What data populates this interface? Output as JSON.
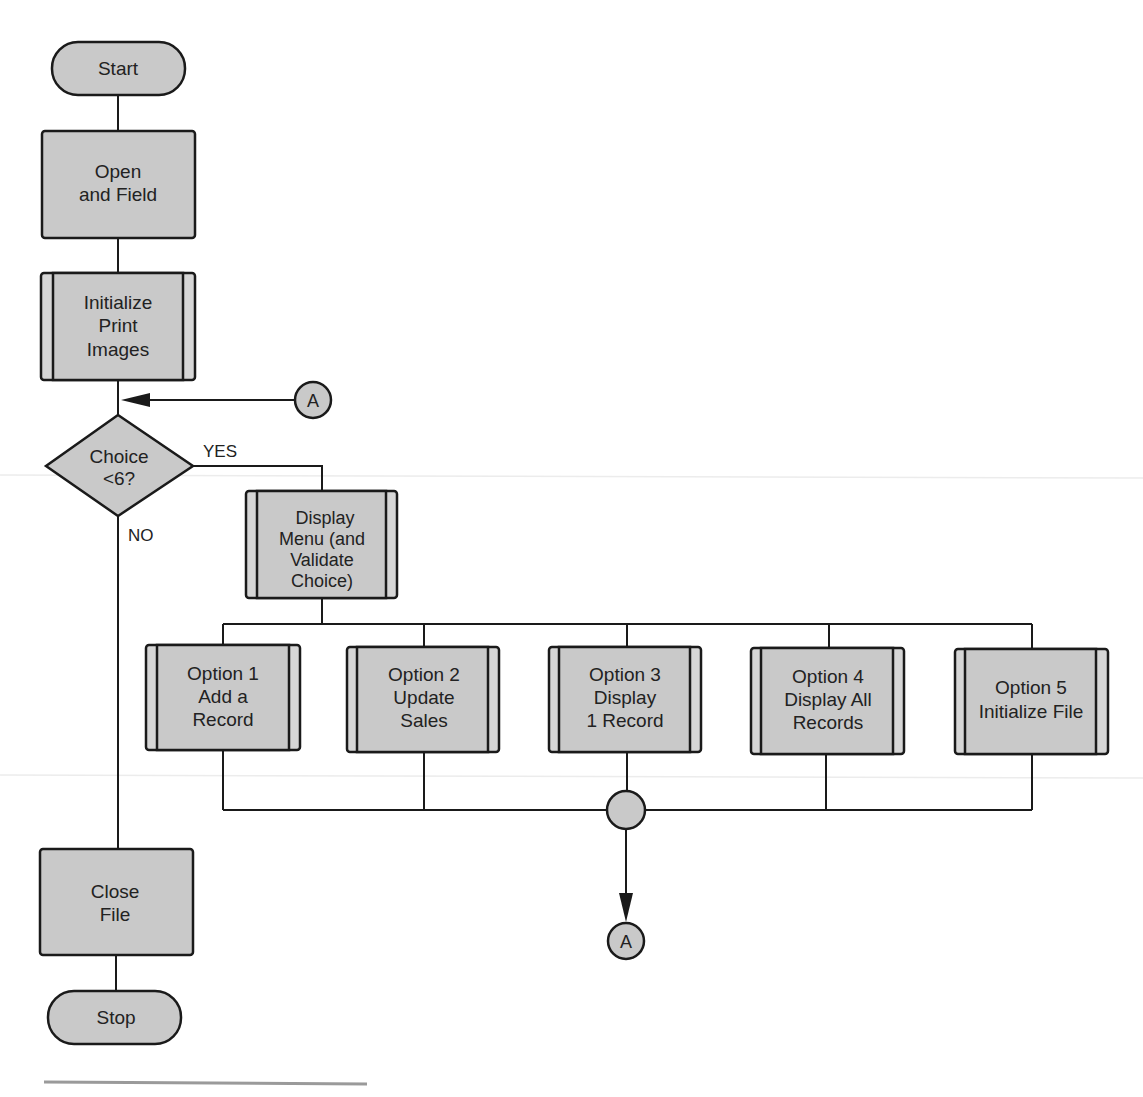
{
  "diagram": {
    "type": "flowchart",
    "colors": {
      "fill": "#c9c9c9",
      "stroke": "#1a1a1a",
      "text": "#222222",
      "background": "#ffffff"
    },
    "nodes": {
      "start": {
        "kind": "terminal",
        "lines": [
          "Start"
        ]
      },
      "open": {
        "kind": "process",
        "lines": [
          "Open",
          "and Field"
        ]
      },
      "init": {
        "kind": "predefined",
        "lines": [
          "Initialize",
          "Print",
          "Images"
        ]
      },
      "choice": {
        "kind": "decision",
        "lines": [
          "Choice",
          "<6?"
        ]
      },
      "display": {
        "kind": "predefined",
        "lines": [
          "Display",
          "Menu  (and",
          "Validate",
          "Choice)"
        ]
      },
      "opt1": {
        "kind": "predefined",
        "lines": [
          "Option 1",
          "Add  a",
          "Record"
        ]
      },
      "opt2": {
        "kind": "predefined",
        "lines": [
          "Option 2",
          "Update",
          "Sales"
        ]
      },
      "opt3": {
        "kind": "predefined",
        "lines": [
          "Option 3",
          "Display",
          "1 Record"
        ]
      },
      "opt4": {
        "kind": "predefined",
        "lines": [
          "Option 4",
          "Display All",
          "Records"
        ]
      },
      "opt5": {
        "kind": "predefined",
        "lines": [
          "Option 5",
          "Initialize File"
        ]
      },
      "close": {
        "kind": "process",
        "lines": [
          "Close",
          "File"
        ]
      },
      "stop": {
        "kind": "terminal",
        "lines": [
          "Stop"
        ]
      },
      "connector_in": {
        "kind": "connector",
        "label": "A"
      },
      "merge": {
        "kind": "junction",
        "label": ""
      },
      "connector_out": {
        "kind": "connector",
        "label": "A"
      }
    },
    "edge_labels": {
      "yes": "YES",
      "no": "NO"
    },
    "edges": [
      [
        "start",
        "open"
      ],
      [
        "open",
        "init"
      ],
      [
        "init",
        "choice"
      ],
      [
        "connector_in",
        "choice"
      ],
      [
        "choice",
        "display",
        "YES"
      ],
      [
        "choice",
        "close",
        "NO"
      ],
      [
        "display",
        "opt1"
      ],
      [
        "display",
        "opt2"
      ],
      [
        "display",
        "opt3"
      ],
      [
        "display",
        "opt4"
      ],
      [
        "display",
        "opt5"
      ],
      [
        "opt1",
        "merge"
      ],
      [
        "opt2",
        "merge"
      ],
      [
        "opt3",
        "merge"
      ],
      [
        "opt4",
        "merge"
      ],
      [
        "opt5",
        "merge"
      ],
      [
        "merge",
        "connector_out"
      ],
      [
        "close",
        "stop"
      ]
    ]
  }
}
